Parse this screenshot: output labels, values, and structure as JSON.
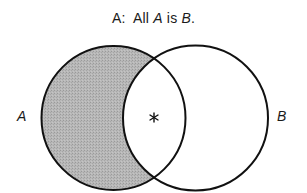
{
  "title": {
    "prefix": "A:",
    "word_all": "All",
    "term1": "A",
    "word_is": "is",
    "term2": "B",
    "period": "."
  },
  "circles": [
    {
      "label": "A",
      "shaded_region": "A minus B",
      "fill": "#b3b3b3"
    },
    {
      "label": "B",
      "fill": "#ffffff"
    }
  ],
  "marker": {
    "symbol": "*",
    "region": "A intersect B"
  },
  "colors": {
    "stroke": "#111111",
    "shade": "#b3b3b3",
    "background": "#ffffff"
  }
}
